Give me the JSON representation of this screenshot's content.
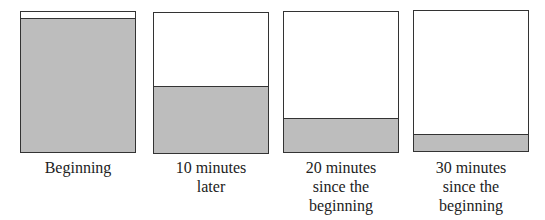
{
  "diagram": {
    "fill_color": "#bdbdbd",
    "border_color": "#333333",
    "panels": [
      {
        "label": "Beginning",
        "fill_fraction": 0.94
      },
      {
        "label": "10 minutes\nlater",
        "fill_fraction": 0.47
      },
      {
        "label": "20 minutes\nsince the\nbeginning",
        "fill_fraction": 0.23
      },
      {
        "label": "30 minutes\nsince the\nbeginning",
        "fill_fraction": 0.11
      }
    ]
  }
}
